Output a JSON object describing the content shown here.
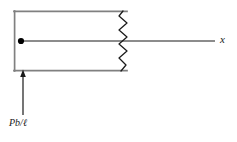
{
  "figure": {
    "background_color": "#ffffff",
    "member_outline_color": "#808080",
    "centerline_color": "#1a1a1a",
    "break_line_color": "#1a1a1a",
    "arrow_color": "#1a1a1a",
    "node_color": "#000000"
  },
  "labels": {
    "axis": "x",
    "load": "Pb/ℓ"
  },
  "geometry": {
    "member": {
      "left": 14,
      "top": 11,
      "right": 127,
      "bottom": 71,
      "stroke_width": 1.6
    },
    "centerline": {
      "x1": 21,
      "y1": 41,
      "x2": 215,
      "y2": 41,
      "stroke_width": 1.1
    },
    "node_dot": {
      "cx": 21,
      "cy": 41,
      "r": 3.1
    },
    "break_zigzag": {
      "x_center": 123,
      "y_top": 11,
      "y_bottom": 71,
      "amplitude": 5,
      "segments": 9,
      "stroke_width": 1.2
    },
    "load_arrow": {
      "x": 23,
      "y_tail": 115,
      "y_head": 71,
      "head_width": 5,
      "head_length": 7,
      "stroke_width": 1.2
    }
  }
}
